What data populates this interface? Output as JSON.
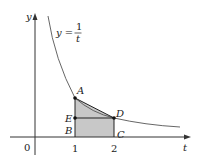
{
  "diagram": {
    "axes": {
      "x_label": "t",
      "y_label": "y",
      "origin_label": "0",
      "ticks": [
        "1",
        "2"
      ]
    },
    "curve": {
      "equation_lhs": "y =",
      "equation_numerator": "1",
      "equation_denominator": "t"
    },
    "points": [
      {
        "label": "A",
        "t": 1,
        "y": 1
      },
      {
        "label": "D",
        "t": 2,
        "y": 0.5
      },
      {
        "label": "E",
        "t": 1,
        "y": 0.5
      },
      {
        "label": "B",
        "t": 1,
        "y": 0
      },
      {
        "label": "C",
        "t": 2,
        "y": 0
      }
    ],
    "shaded_region": "Trapezoid ABCD (region under chord AD from t=1 to t=2)",
    "colors": {
      "axis": "#333333",
      "curve": "#555555",
      "shade": "#c8c8c8",
      "point": "#111111"
    }
  }
}
